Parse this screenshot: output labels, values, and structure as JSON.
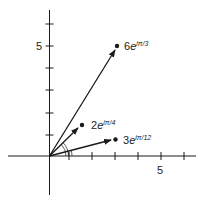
{
  "diagram": {
    "type": "complex-plane-vectors",
    "axes": {
      "x_tick_label": "5",
      "y_tick_label": "5",
      "x_ticks": [
        1,
        2,
        3,
        4,
        5,
        6
      ],
      "y_ticks": [
        1,
        2,
        3,
        4,
        5,
        6
      ]
    },
    "vectors": [
      {
        "label_coef": "6",
        "label_base": "e",
        "label_exp": "iπ/3",
        "modulus": 6,
        "angle_deg": 60
      },
      {
        "label_coef": "2",
        "label_base": "e",
        "label_exp": "iπ/4",
        "modulus": 2,
        "angle_deg": 45
      },
      {
        "label_coef": "3",
        "label_base": "e",
        "label_exp": "iπ/12",
        "modulus": 3,
        "angle_deg": 15
      }
    ],
    "colors": {
      "stroke": "#1a1a1a",
      "background": "#ffffff"
    }
  }
}
